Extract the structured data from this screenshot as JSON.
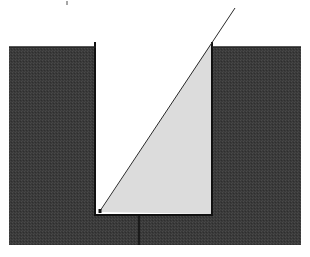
{
  "diagram": {
    "colors": {
      "background": "#ffffff",
      "block": "#3a3a3a",
      "wedge": "#dcdcdc",
      "line": "#2a2a2a",
      "outline": "#111111"
    },
    "block": {
      "x": 9,
      "y": 47,
      "width": 292,
      "height": 198
    },
    "slot": {
      "left": 96,
      "right": 212,
      "top": 47,
      "bottom": 215
    },
    "left_post": {
      "x": 95,
      "y1": 42,
      "y2": 215
    },
    "right_post": {
      "x": 212,
      "y1": 42,
      "y2": 215
    },
    "wedge": {
      "points": [
        [
          100,
          212
        ],
        [
          212,
          42
        ],
        [
          212,
          214
        ]
      ]
    },
    "slope_line": {
      "x1": 100,
      "y1": 211,
      "x2": 235,
      "y2": 8
    },
    "base_marker": {
      "x": 100,
      "y": 211
    },
    "vertical_tick": {
      "x": 139,
      "y1": 215,
      "y2": 245
    },
    "top_mark": {
      "x": 67,
      "y1": 1,
      "y2": 5
    }
  }
}
